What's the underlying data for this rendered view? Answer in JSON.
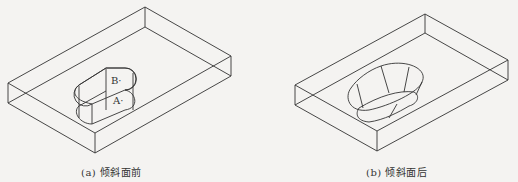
{
  "figures": [
    {
      "id": "a",
      "caption": "(a) 倾斜面前",
      "point_labels": [
        "B·",
        "A·"
      ]
    },
    {
      "id": "b",
      "caption": "(b) 倾斜面后"
    }
  ],
  "colors": {
    "line": "#333333",
    "background": "#f4f3f1"
  }
}
